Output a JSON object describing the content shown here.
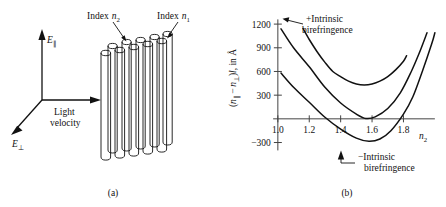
{
  "figure": {
    "panels": [
      {
        "id": "a",
        "caption": "(a)",
        "labels": {
          "index_n2": "Index",
          "index_n2_sub": "n",
          "index_n2_subsub": "2",
          "index_n1": "Index",
          "index_n1_sub": "n",
          "index_n1_subsub": "1",
          "e_parallel": "E",
          "e_parallel_sub": "∥",
          "e_perp": "E",
          "e_perp_sub": "⊥",
          "light_velocity_line1": "Light",
          "light_velocity_line2": "velocity"
        },
        "icons": {
          "axis_up": "arrow-up-icon",
          "axis_right": "arrow-right-icon",
          "axis_diagonal": "arrow-down-left-icon",
          "rod_bundle": "rod-bundle-icon",
          "leader_n2": "leader-arrow-icon",
          "leader_n1": "leader-arrow-icon"
        },
        "rods": {
          "back_row_count": 5,
          "front_row_count": 5,
          "description": "bundle of parallel cylindrical rods, two staggered rows"
        }
      },
      {
        "id": "b",
        "caption": "(b)",
        "annotations": [
          {
            "name": "plus-intrinsic-birefringence",
            "line1": "+Intrinsic",
            "line2": "birefringence",
            "leader": "leader-arrow-left-icon"
          },
          {
            "name": "minus-intrinsic-birefringence",
            "line1": "−Intrinsic",
            "line2": "birefringence",
            "leader": "leader-arrow-up-icon"
          }
        ]
      }
    ]
  },
  "chart_data": {
    "type": "line",
    "title": "",
    "xlabel": "n₂",
    "xlabel_base": "n",
    "xlabel_sub": "2",
    "ylabel": "(n∥ − n⊥)l, in Å",
    "ylabel_parts": {
      "open": "(",
      "n1": "n",
      "sub1": "∥",
      "minus": "−",
      "n2": "n",
      "sub2": "⊥",
      "close": ")",
      "ell": "l",
      "tail": ", in Å"
    },
    "xlim": [
      0.95,
      2.02
    ],
    "ylim": [
      -420,
      1290
    ],
    "xticks": [
      1.0,
      1.2,
      1.4,
      1.6,
      1.8
    ],
    "xtick_labels": [
      "1.0",
      "1.2",
      "1.4",
      "1.6",
      "1.8"
    ],
    "yticks": [
      -300,
      300,
      600,
      900,
      1200
    ],
    "ytick_labels": [
      "−300",
      "300",
      "600",
      "900",
      "1200"
    ],
    "grid": false,
    "legend": "none",
    "series": [
      {
        "name": "+Intrinsic birefringence",
        "vertex_x": 1.55,
        "vertex_y": 430,
        "curvature": 4700,
        "x_start": 1.16,
        "x_end": 1.82,
        "points": [
          [
            1.16,
            1145
          ],
          [
            1.2,
            1005
          ],
          [
            1.25,
            850
          ],
          [
            1.3,
            715
          ],
          [
            1.35,
            600
          ],
          [
            1.4,
            535
          ],
          [
            1.45,
            477
          ],
          [
            1.5,
            442
          ],
          [
            1.55,
            430
          ],
          [
            1.6,
            442
          ],
          [
            1.65,
            477
          ],
          [
            1.7,
            535
          ],
          [
            1.75,
            620
          ],
          [
            1.8,
            730
          ],
          [
            1.82,
            800
          ]
        ]
      },
      {
        "name": "zero intrinsic birefringence",
        "vertex_x": 1.56,
        "vertex_y": 5,
        "curvature": 4700,
        "x_start": 1.02,
        "x_end": 1.95,
        "points": [
          [
            1.02,
            1140
          ],
          [
            1.1,
            900
          ],
          [
            1.2,
            660
          ],
          [
            1.3,
            400
          ],
          [
            1.4,
            200
          ],
          [
            1.5,
            60
          ],
          [
            1.56,
            5
          ],
          [
            1.62,
            25
          ],
          [
            1.7,
            130
          ],
          [
            1.78,
            330
          ],
          [
            1.85,
            600
          ],
          [
            1.9,
            830
          ],
          [
            1.95,
            1090
          ]
        ]
      },
      {
        "name": "−Intrinsic birefringence",
        "vertex_x": 1.58,
        "vertex_y": -280,
        "curvature": 4700,
        "x_start": 1.02,
        "x_end": 2.0,
        "points": [
          [
            1.02,
            580
          ],
          [
            1.1,
            400
          ],
          [
            1.2,
            210
          ],
          [
            1.3,
            20
          ],
          [
            1.4,
            -130
          ],
          [
            1.5,
            -245
          ],
          [
            1.58,
            -285
          ],
          [
            1.65,
            -255
          ],
          [
            1.72,
            -150
          ],
          [
            1.8,
            60
          ],
          [
            1.86,
            280
          ],
          [
            1.92,
            600
          ],
          [
            1.98,
            950
          ],
          [
            2.0,
            1090
          ]
        ]
      }
    ]
  },
  "style": {
    "line_color": "#111111",
    "axis_color": "#444444",
    "background": "#ffffff",
    "text_color": "#111111"
  }
}
